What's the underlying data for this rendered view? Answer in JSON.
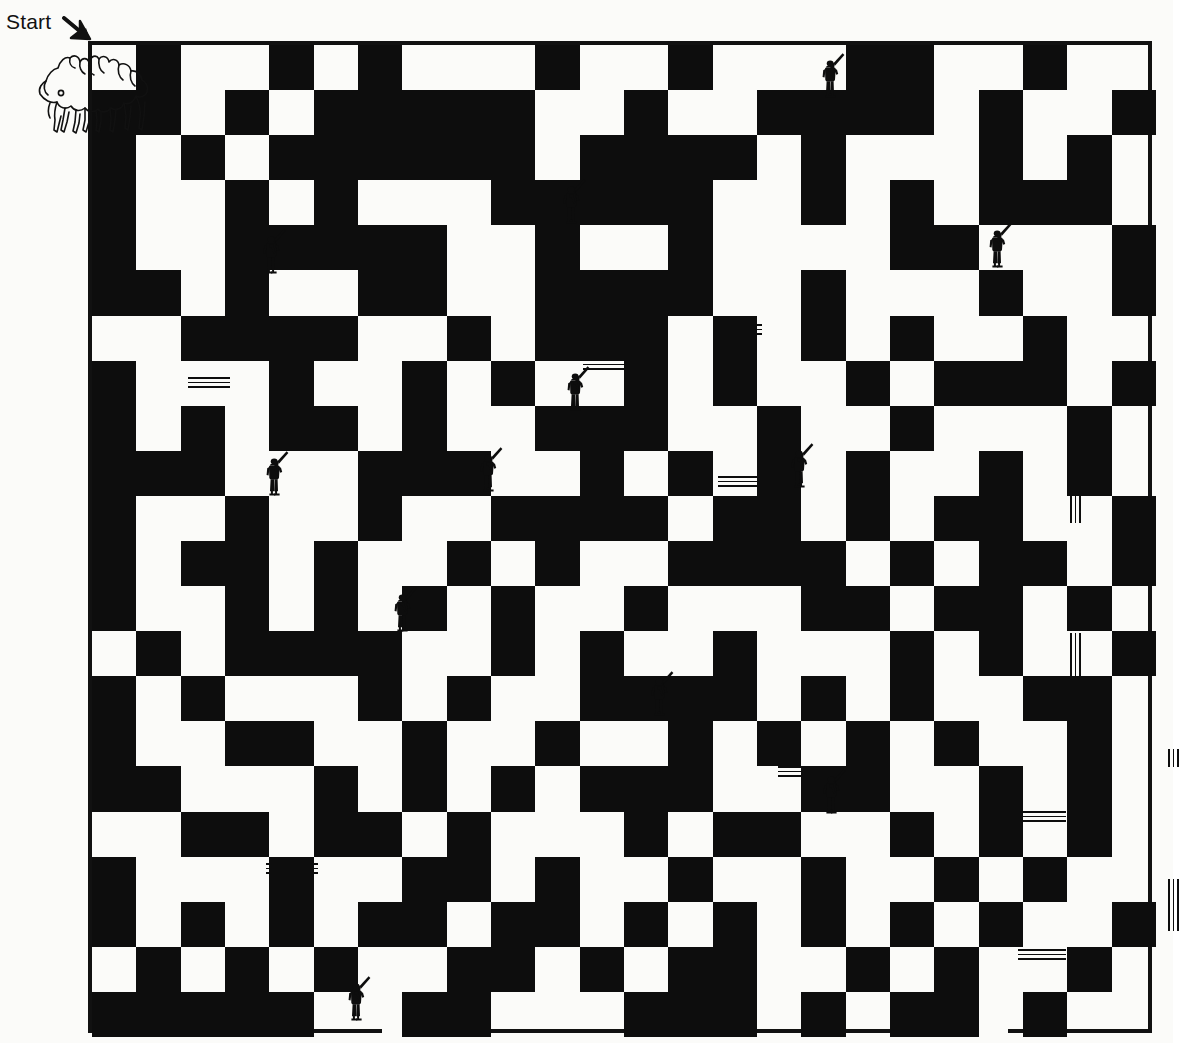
{
  "page": {
    "background_color": "#fbfbf9",
    "ink_color": "#0d0d0d"
  },
  "labels": {
    "start_text": "Start",
    "start_arrow_icon": "arrow-down-right-icon"
  },
  "maze": {
    "frame": {
      "x": 88,
      "y": 41,
      "width": 1064,
      "height": 992,
      "border_width": 4
    },
    "grid": {
      "cols": 24,
      "rows": 22,
      "cell_width": 44.33,
      "cell_height": 45.09
    },
    "entrance": {
      "side": "top",
      "x": 4,
      "width": 72
    },
    "exit": {
      "side": "bottom",
      "x": 294,
      "width": 44
    },
    "exit_secondary": {
      "side": "bottom",
      "x": 876,
      "width": 44
    },
    "blocks": [
      [
        1,
        0,
        1,
        2
      ],
      [
        4,
        0,
        1,
        1
      ],
      [
        6,
        0,
        1,
        1
      ],
      [
        10,
        0,
        1,
        1
      ],
      [
        13,
        0,
        1,
        1
      ],
      [
        17,
        0,
        2,
        1
      ],
      [
        21,
        0,
        1,
        1
      ],
      [
        0,
        1,
        1,
        5
      ],
      [
        3,
        1,
        1,
        1
      ],
      [
        5,
        1,
        5,
        2
      ],
      [
        12,
        1,
        1,
        2
      ],
      [
        15,
        1,
        4,
        1
      ],
      [
        20,
        1,
        1,
        3
      ],
      [
        23,
        1,
        1,
        1
      ],
      [
        2,
        2,
        1,
        1
      ],
      [
        4,
        2,
        1,
        1
      ],
      [
        11,
        2,
        4,
        1
      ],
      [
        16,
        2,
        1,
        2
      ],
      [
        22,
        2,
        1,
        2
      ],
      [
        3,
        3,
        1,
        4
      ],
      [
        5,
        3,
        1,
        1
      ],
      [
        9,
        3,
        4,
        1
      ],
      [
        10,
        4,
        1,
        2
      ],
      [
        13,
        3,
        1,
        3
      ],
      [
        18,
        3,
        1,
        2
      ],
      [
        21,
        3,
        1,
        1
      ],
      [
        0,
        4,
        1,
        1
      ],
      [
        4,
        4,
        3,
        1
      ],
      [
        7,
        4,
        1,
        2
      ],
      [
        19,
        4,
        1,
        1
      ],
      [
        23,
        4,
        1,
        2
      ],
      [
        1,
        5,
        1,
        1
      ],
      [
        6,
        5,
        1,
        1
      ],
      [
        11,
        5,
        3,
        1
      ],
      [
        16,
        5,
        1,
        2
      ],
      [
        20,
        5,
        1,
        1
      ],
      [
        2,
        6,
        4,
        1
      ],
      [
        8,
        6,
        1,
        1
      ],
      [
        10,
        6,
        3,
        1
      ],
      [
        14,
        6,
        1,
        2
      ],
      [
        18,
        6,
        1,
        1
      ],
      [
        21,
        6,
        1,
        2
      ],
      [
        0,
        7,
        1,
        4
      ],
      [
        4,
        7,
        1,
        2
      ],
      [
        7,
        7,
        1,
        3
      ],
      [
        9,
        7,
        1,
        1
      ],
      [
        12,
        7,
        1,
        2
      ],
      [
        17,
        7,
        1,
        1
      ],
      [
        19,
        7,
        2,
        1
      ],
      [
        23,
        7,
        1,
        1
      ],
      [
        2,
        8,
        1,
        1
      ],
      [
        5,
        8,
        1,
        1
      ],
      [
        10,
        8,
        2,
        1
      ],
      [
        15,
        8,
        1,
        4
      ],
      [
        18,
        8,
        1,
        1
      ],
      [
        22,
        8,
        1,
        2
      ],
      [
        1,
        9,
        2,
        1
      ],
      [
        6,
        9,
        1,
        2
      ],
      [
        8,
        9,
        1,
        1
      ],
      [
        11,
        9,
        1,
        2
      ],
      [
        13,
        9,
        1,
        1
      ],
      [
        17,
        9,
        1,
        2
      ],
      [
        20,
        9,
        1,
        3
      ],
      [
        3,
        10,
        1,
        1
      ],
      [
        9,
        10,
        2,
        1
      ],
      [
        12,
        10,
        1,
        1
      ],
      [
        14,
        10,
        1,
        1
      ],
      [
        19,
        10,
        1,
        1
      ],
      [
        23,
        10,
        1,
        2
      ],
      [
        0,
        11,
        1,
        2
      ],
      [
        2,
        11,
        2,
        1
      ],
      [
        5,
        11,
        1,
        2
      ],
      [
        8,
        11,
        1,
        1
      ],
      [
        10,
        11,
        1,
        1
      ],
      [
        13,
        11,
        2,
        1
      ],
      [
        16,
        11,
        1,
        2
      ],
      [
        18,
        11,
        1,
        1
      ],
      [
        21,
        11,
        1,
        1
      ],
      [
        3,
        12,
        1,
        2
      ],
      [
        7,
        12,
        1,
        1
      ],
      [
        9,
        12,
        1,
        2
      ],
      [
        12,
        12,
        1,
        1
      ],
      [
        17,
        12,
        1,
        1
      ],
      [
        19,
        12,
        2,
        1
      ],
      [
        22,
        12,
        1,
        1
      ],
      [
        1,
        13,
        1,
        1
      ],
      [
        4,
        13,
        2,
        1
      ],
      [
        6,
        13,
        1,
        2
      ],
      [
        11,
        13,
        1,
        2
      ],
      [
        14,
        13,
        1,
        2
      ],
      [
        18,
        13,
        1,
        2
      ],
      [
        20,
        13,
        1,
        1
      ],
      [
        23,
        13,
        1,
        1
      ],
      [
        0,
        14,
        1,
        3
      ],
      [
        2,
        14,
        1,
        1
      ],
      [
        8,
        14,
        1,
        1
      ],
      [
        12,
        14,
        2,
        1
      ],
      [
        16,
        14,
        1,
        1
      ],
      [
        21,
        14,
        2,
        1
      ],
      [
        3,
        15,
        2,
        1
      ],
      [
        7,
        15,
        1,
        2
      ],
      [
        10,
        15,
        1,
        1
      ],
      [
        13,
        15,
        1,
        2
      ],
      [
        15,
        15,
        1,
        1
      ],
      [
        17,
        15,
        1,
        2
      ],
      [
        19,
        15,
        1,
        1
      ],
      [
        22,
        15,
        1,
        2
      ],
      [
        1,
        16,
        1,
        1
      ],
      [
        5,
        16,
        1,
        2
      ],
      [
        9,
        16,
        1,
        1
      ],
      [
        11,
        16,
        2,
        1
      ],
      [
        16,
        16,
        1,
        1
      ],
      [
        20,
        16,
        1,
        2
      ],
      [
        2,
        17,
        2,
        1
      ],
      [
        6,
        17,
        1,
        1
      ],
      [
        8,
        17,
        1,
        2
      ],
      [
        12,
        17,
        1,
        1
      ],
      [
        14,
        17,
        2,
        1
      ],
      [
        18,
        17,
        1,
        1
      ],
      [
        22,
        17,
        1,
        1
      ],
      [
        0,
        18,
        1,
        2
      ],
      [
        4,
        18,
        1,
        2
      ],
      [
        7,
        18,
        1,
        1
      ],
      [
        10,
        18,
        1,
        2
      ],
      [
        13,
        18,
        1,
        1
      ],
      [
        16,
        18,
        1,
        2
      ],
      [
        19,
        18,
        1,
        1
      ],
      [
        21,
        18,
        1,
        1
      ],
      [
        2,
        19,
        1,
        1
      ],
      [
        6,
        19,
        2,
        1
      ],
      [
        9,
        19,
        1,
        1
      ],
      [
        12,
        19,
        1,
        1
      ],
      [
        14,
        19,
        1,
        1
      ],
      [
        18,
        19,
        1,
        1
      ],
      [
        20,
        19,
        1,
        1
      ],
      [
        23,
        19,
        1,
        1
      ],
      [
        1,
        20,
        1,
        2
      ],
      [
        3,
        20,
        1,
        1
      ],
      [
        5,
        20,
        1,
        1
      ],
      [
        8,
        20,
        2,
        1
      ],
      [
        11,
        20,
        1,
        1
      ],
      [
        13,
        20,
        2,
        1
      ],
      [
        17,
        20,
        1,
        1
      ],
      [
        19,
        20,
        1,
        1
      ],
      [
        22,
        20,
        1,
        1
      ],
      [
        0,
        21,
        1,
        1
      ],
      [
        2,
        21,
        2,
        1
      ],
      [
        4,
        21,
        1,
        1
      ],
      [
        7,
        21,
        2,
        1
      ],
      [
        12,
        21,
        3,
        1
      ],
      [
        16,
        21,
        1,
        1
      ],
      [
        18,
        21,
        2,
        1
      ],
      [
        21,
        21,
        1,
        1
      ]
    ],
    "bridges": [
      {
        "orient": "h",
        "x": 100,
        "y": 336,
        "length": 42
      },
      {
        "orient": "h",
        "x": 495,
        "y": 318,
        "length": 62
      },
      {
        "orient": "h",
        "x": 178,
        "y": 590,
        "length": 50
      },
      {
        "orient": "h",
        "x": 630,
        "y": 435,
        "length": 52
      },
      {
        "orient": "v",
        "x": 982,
        "y": 430,
        "length": 52
      },
      {
        "orient": "v",
        "x": 982,
        "y": 592,
        "length": 60
      },
      {
        "orient": "h",
        "x": 178,
        "y": 822,
        "length": 52
      },
      {
        "orient": "h",
        "x": 690,
        "y": 725,
        "length": 52
      },
      {
        "orient": "v",
        "x": 1080,
        "y": 708,
        "length": 18
      },
      {
        "orient": "h",
        "x": 930,
        "y": 770,
        "length": 48
      },
      {
        "orient": "v",
        "x": 1080,
        "y": 838,
        "length": 52
      },
      {
        "orient": "h",
        "x": 930,
        "y": 908,
        "length": 48
      },
      {
        "orient": "h",
        "x": 630,
        "y": 283,
        "length": 44
      }
    ],
    "soldiers": [
      {
        "id": "soldier-1",
        "x": 820,
        "y": 52
      },
      {
        "id": "soldier-2",
        "x": 561,
        "y": 178
      },
      {
        "id": "soldier-3",
        "x": 261,
        "y": 228
      },
      {
        "id": "soldier-4",
        "x": 987,
        "y": 222
      },
      {
        "id": "soldier-5",
        "x": 565,
        "y": 365
      },
      {
        "id": "soldier-6",
        "x": 478,
        "y": 446
      },
      {
        "id": "soldier-7",
        "x": 264,
        "y": 450
      },
      {
        "id": "soldier-8",
        "x": 789,
        "y": 442
      },
      {
        "id": "soldier-9",
        "x": 392,
        "y": 586
      },
      {
        "id": "soldier-10",
        "x": 649,
        "y": 670
      },
      {
        "id": "soldier-11",
        "x": 821,
        "y": 768
      },
      {
        "id": "soldier-12",
        "x": 346,
        "y": 975
      }
    ],
    "artwork": {
      "name": "camel-caravan-outline",
      "x": 32,
      "y": 50,
      "width": 122,
      "height": 95,
      "description": "line-art outline of camels with riders"
    }
  }
}
